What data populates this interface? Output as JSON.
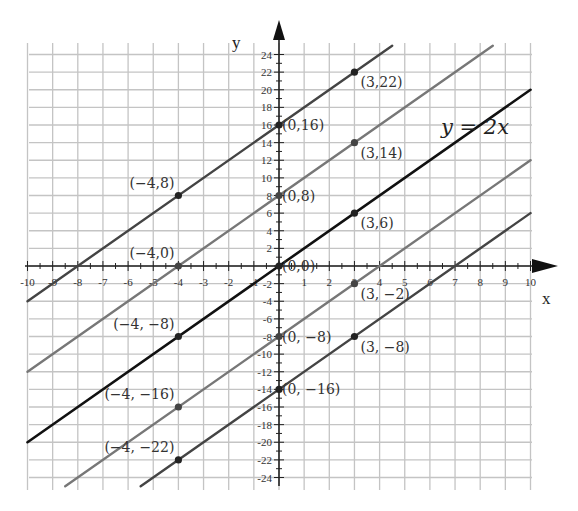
{
  "chart_data": {
    "type": "line",
    "title": "",
    "xlabel": "x",
    "ylabel": "y",
    "xlim": [
      -10,
      10
    ],
    "ylim": [
      -24,
      24
    ],
    "grid": true,
    "x_ticks": [
      -10,
      -9,
      -8,
      -7,
      -6,
      -5,
      -4,
      -3,
      -2,
      -1,
      1,
      2,
      3,
      4,
      5,
      6,
      7,
      8,
      9,
      10
    ],
    "y_ticks": [
      -24,
      -22,
      -20,
      -18,
      -16,
      -14,
      -12,
      -10,
      -8,
      -6,
      -4,
      -2,
      2,
      4,
      6,
      8,
      10,
      12,
      14,
      16,
      18,
      20,
      22,
      24
    ],
    "annotation": "y = 2x",
    "series": [
      {
        "name": "y = 2x + 16",
        "slope": 2,
        "intercept": 16,
        "color": "#444444",
        "points": [
          {
            "x": -4,
            "y": 8,
            "label": "(−4,8)"
          },
          {
            "x": 0,
            "y": 16,
            "label": "(0,16)"
          },
          {
            "x": 3,
            "y": 22,
            "label": "(3,22)"
          }
        ]
      },
      {
        "name": "y = 2x + 8",
        "slope": 2,
        "intercept": 8,
        "color": "#777777",
        "points": [
          {
            "x": -4,
            "y": 0,
            "label": "(−4,0)"
          },
          {
            "x": 0,
            "y": 8,
            "label": "(0,8)"
          },
          {
            "x": 3,
            "y": 14,
            "label": "(3,14)"
          }
        ]
      },
      {
        "name": "y = 2x",
        "slope": 2,
        "intercept": 0,
        "color": "#111111",
        "points": [
          {
            "x": -4,
            "y": -8,
            "label": "(−4, −8)"
          },
          {
            "x": 0,
            "y": 0,
            "label": "(0,0)"
          },
          {
            "x": 3,
            "y": 6,
            "label": "(3,6)"
          }
        ]
      },
      {
        "name": "y = 2x − 8",
        "slope": 2,
        "intercept": -8,
        "color": "#777777",
        "points": [
          {
            "x": -4,
            "y": -16,
            "label": "(−4, −16)"
          },
          {
            "x": 0,
            "y": -8,
            "label": "(0, −8)"
          },
          {
            "x": 3,
            "y": -2,
            "label": "(3, −2)"
          }
        ]
      },
      {
        "name": "y = 2x − 14",
        "slope": 2,
        "intercept": -14,
        "color": "#444444",
        "points": [
          {
            "x": -4,
            "y": -22,
            "label": "(−4, −22)"
          },
          {
            "x": 0,
            "y": -14,
            "label": "(0, −16)"
          },
          {
            "x": 3,
            "y": -8,
            "label": "(3, −8)"
          }
        ]
      }
    ]
  },
  "labels": {
    "x_axis": "x",
    "y_axis": "y",
    "equation": "y = 2x"
  }
}
